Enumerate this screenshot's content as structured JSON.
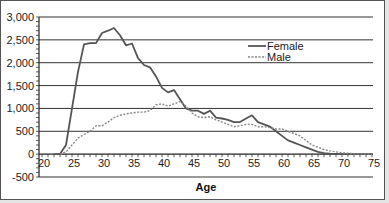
{
  "chart_data": {
    "type": "line",
    "title": "",
    "xlabel": "Age",
    "ylabel": "",
    "xlim": [
      20,
      75
    ],
    "ylim": [
      -500,
      3000
    ],
    "x_ticks": [
      20,
      25,
      30,
      35,
      40,
      45,
      50,
      55,
      60,
      65,
      70,
      75
    ],
    "y_ticks": [
      3000,
      2500,
      2000,
      1500,
      1000,
      500,
      0,
      -500
    ],
    "y_tick_labels": [
      "3,000",
      "2,500",
      "2,000",
      "1,500",
      "1,000",
      "500",
      "0",
      "-500"
    ],
    "x_tick_labels": [
      "20",
      "25",
      "30",
      "35",
      "40",
      "45",
      "50",
      "55",
      "60",
      "65",
      "70",
      "75"
    ],
    "grid": "horizontal",
    "legend_position": "upper right inside",
    "series": [
      {
        "name": "Female",
        "style": "solid",
        "color": "#555555",
        "x": [
          22,
          23,
          24,
          25,
          26,
          27,
          28,
          29,
          30,
          31,
          32,
          33,
          34,
          35,
          36,
          37,
          38,
          39,
          40,
          41,
          42,
          43,
          44,
          45,
          46,
          47,
          48,
          49,
          50,
          51,
          52,
          53,
          54,
          55,
          56,
          57,
          58,
          59,
          60,
          61,
          62,
          63,
          64,
          65,
          66,
          67,
          68,
          70,
          75
        ],
        "values": [
          0,
          0,
          200,
          1000,
          1800,
          2400,
          2430,
          2430,
          2650,
          2700,
          2760,
          2600,
          2380,
          2420,
          2100,
          1950,
          1900,
          1700,
          1450,
          1350,
          1400,
          1200,
          1000,
          950,
          950,
          880,
          950,
          800,
          780,
          750,
          700,
          700,
          780,
          850,
          700,
          650,
          600,
          500,
          400,
          300,
          250,
          200,
          150,
          100,
          50,
          20,
          10,
          0,
          0
        ]
      },
      {
        "name": "Male",
        "style": "dashed",
        "color": "#888888",
        "x": [
          23,
          24,
          25,
          26,
          27,
          28,
          29,
          30,
          31,
          32,
          33,
          34,
          35,
          36,
          37,
          38,
          39,
          40,
          41,
          42,
          43,
          44,
          45,
          46,
          47,
          48,
          49,
          50,
          51,
          52,
          53,
          54,
          55,
          56,
          57,
          58,
          59,
          60,
          61,
          62,
          63,
          64,
          65,
          66,
          67,
          68,
          70,
          72,
          75
        ],
        "values": [
          0,
          50,
          200,
          350,
          430,
          500,
          620,
          620,
          700,
          800,
          850,
          880,
          900,
          920,
          920,
          950,
          1080,
          1100,
          1050,
          1100,
          1150,
          1050,
          900,
          820,
          800,
          820,
          750,
          700,
          650,
          600,
          620,
          650,
          650,
          600,
          600,
          580,
          550,
          550,
          500,
          450,
          400,
          300,
          200,
          150,
          100,
          70,
          30,
          10,
          0
        ]
      }
    ]
  }
}
